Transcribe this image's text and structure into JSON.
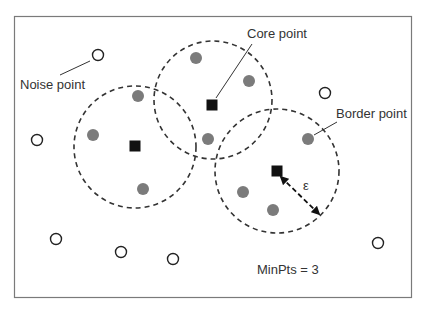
{
  "diagram": {
    "colors": {
      "frame": "#7a7a7a",
      "dashed_circle": "#333333",
      "core_point": "#111111",
      "border_point": "#7b7b7b",
      "noise_point_stroke": "#222222",
      "text": "#333333"
    },
    "labels": {
      "noise": "Noise point",
      "core": "Core point",
      "border": "Border point",
      "epsilon": "ε",
      "minpts": "MinPts = 3"
    },
    "neighborhoods": [
      {
        "cx": 135,
        "cy": 147,
        "r": 61
      },
      {
        "cx": 213,
        "cy": 100,
        "r": 59
      },
      {
        "cx": 277,
        "cy": 171,
        "r": 62
      }
    ],
    "core_points": [
      {
        "x": 135,
        "y": 146
      },
      {
        "x": 212,
        "y": 105
      },
      {
        "x": 277,
        "y": 171
      }
    ],
    "border_points": [
      {
        "x": 138,
        "y": 96
      },
      {
        "x": 93,
        "y": 135
      },
      {
        "x": 143,
        "y": 189
      },
      {
        "x": 196,
        "y": 58
      },
      {
        "x": 249,
        "y": 81
      },
      {
        "x": 208,
        "y": 139
      },
      {
        "x": 308,
        "y": 139
      },
      {
        "x": 243,
        "y": 192
      },
      {
        "x": 273,
        "y": 210
      }
    ],
    "noise_points": [
      {
        "x": 98,
        "y": 55
      },
      {
        "x": 37,
        "y": 140
      },
      {
        "x": 325,
        "y": 93
      },
      {
        "x": 56,
        "y": 239
      },
      {
        "x": 121,
        "y": 252
      },
      {
        "x": 173,
        "y": 259
      },
      {
        "x": 378,
        "y": 243
      }
    ]
  }
}
